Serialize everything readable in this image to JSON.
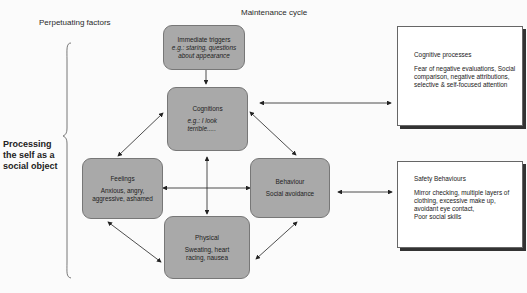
{
  "headers": {
    "left": "Perpetuating factors",
    "center": "Maintenance cycle"
  },
  "side_label": {
    "line1": "Processing",
    "line2": "the self as a",
    "line3": "social object"
  },
  "nodes": {
    "triggers": {
      "title": "Immediate triggers",
      "desc": "e.g.: staring, questions about appearance"
    },
    "cognitions": {
      "title": "Cognitions",
      "desc": "e.g.: I look terrible....."
    },
    "feelings": {
      "title": "Feelings",
      "desc": "Anxious, angry, aggressive, ashamed"
    },
    "behaviour": {
      "title": "Behaviour",
      "desc": "Social avoidance"
    },
    "physical": {
      "title": "Physical",
      "desc": "Sweating, heart racing, nausea"
    }
  },
  "boxes": {
    "cognitive_processes": {
      "title": "Cognitive processes",
      "desc": "Fear of negative evaluations, Social comparison, negative attributions, selective & self-focused attention"
    },
    "safety_behaviours": {
      "title": "Safety Behaviours",
      "desc1": "Mirror checking, multiple layers of clothing, excessive make up, avoidant  eye contact,",
      "desc2": "Poor social skills"
    }
  },
  "colors": {
    "node_fill": "#a9a9a9",
    "node_border": "#777777",
    "box_shadow": "#333333",
    "background": "#fbfbfb"
  }
}
